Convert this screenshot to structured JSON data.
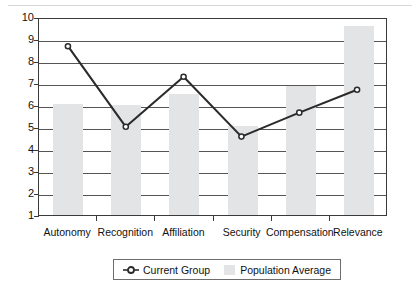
{
  "chart_data": {
    "type": "bar",
    "title": "",
    "xlabel": "",
    "ylabel": "",
    "categories": [
      "Autonomy",
      "Recognition",
      "Affiliation",
      "Security",
      "Compensation",
      "Relevance"
    ],
    "ylim": [
      1,
      10
    ],
    "yticks": [
      1,
      2,
      3,
      4,
      5,
      6,
      7,
      8,
      9,
      10
    ],
    "grid": true,
    "legend_position": "bottom",
    "series": [
      {
        "name": "Current Group",
        "type": "line",
        "marker": "open-circle",
        "color": "#2b2b2b",
        "values": [
          8.75,
          5.05,
          7.35,
          4.6,
          5.7,
          6.75
        ]
      },
      {
        "name": "Population Average",
        "type": "bar",
        "color": "#e3e4e6",
        "values": [
          6.05,
          6.0,
          6.5,
          5.05,
          6.85,
          9.6
        ]
      }
    ]
  },
  "legend": {
    "entries": [
      {
        "label": "Current Group",
        "key": "line-marker"
      },
      {
        "label": "Population Average",
        "key": "bar-swatch"
      }
    ]
  }
}
